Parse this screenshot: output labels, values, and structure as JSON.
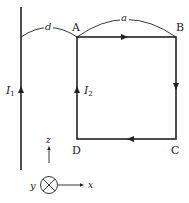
{
  "diagram": {
    "wire": {
      "current_label": "I",
      "current_sub": "1",
      "direction": "up"
    },
    "loop": {
      "current_label": "I",
      "current_sub": "2",
      "corners": {
        "A": "A",
        "B": "B",
        "C": "C",
        "D": "D"
      },
      "direction": "A→B→C→D→A"
    },
    "dimensions": {
      "wire_to_loop": "d",
      "side": "a"
    },
    "axes": {
      "z": "z",
      "x": "x",
      "y": "y",
      "y_direction": "into page"
    },
    "colors": {
      "stroke": "#222222",
      "background": "#ffffff"
    }
  }
}
